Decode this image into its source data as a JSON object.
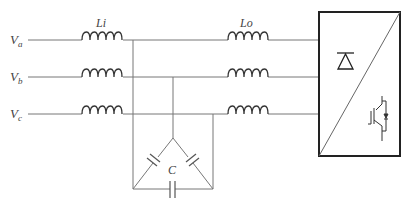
{
  "diagram": {
    "title": "",
    "sources": [
      {
        "label": "V",
        "sub": "a"
      },
      {
        "label": "V",
        "sub": "b"
      },
      {
        "label": "V",
        "sub": "c"
      }
    ],
    "input_inductor_label": "Li",
    "output_inductor_label": "Lo",
    "capacitor_label": "C",
    "converter": {
      "top_symbol": "diode-icon",
      "bottom_symbol": "igbt-icon"
    }
  }
}
